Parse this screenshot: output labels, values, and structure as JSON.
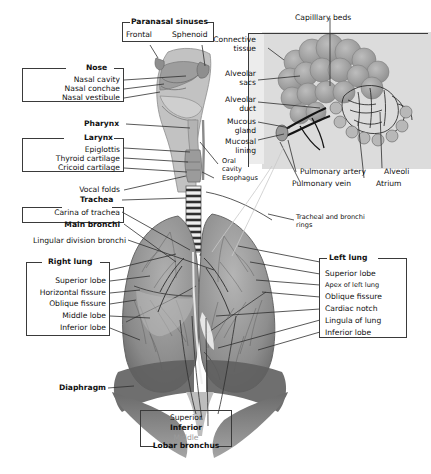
{
  "figure": {
    "style": "grayscale medical illustration with leader-line callouts"
  },
  "groups": {
    "paranasal_sinuses": {
      "header": "Paranasal sinuses",
      "items": [
        "Frontal",
        "Sphenoid"
      ]
    },
    "nose": {
      "header": "Nose",
      "items": [
        "Nasal cavity",
        "Nasal conchae",
        "Nasal vestibule"
      ]
    },
    "pharynx": {
      "header": "Pharynx"
    },
    "larynx": {
      "header": "Larynx",
      "items": [
        "Epiglottis",
        "Thyroid cartilage",
        "Cricoid cartilage"
      ]
    },
    "vocal_folds": {
      "label": "Vocal folds"
    },
    "trachea": {
      "header": "Trachea",
      "items": [
        "Carina of trachea"
      ]
    },
    "main_bronchi": {
      "label": "Main bronchi"
    },
    "lingular_division_bronchi": {
      "label": "Lingular division bronchi"
    },
    "right_lung": {
      "header": "Right lung",
      "items": [
        "Superior lobe",
        "Horizontal fissure",
        "Oblique fissure",
        "Middle lobe",
        "Inferior lobe"
      ]
    },
    "left_lung": {
      "header": "Left lung",
      "items": [
        "Superior lobe",
        "Apex of left lung",
        "Oblique fissure",
        "Cardiac notch",
        "Lingula of lung",
        "Inferior lobe"
      ]
    },
    "diaphragm": {
      "label": "Diaphragm"
    },
    "lobar_bronchus": {
      "header": "Lobar bronchus",
      "items": [
        "Superior",
        "Inferior",
        "Middle"
      ]
    },
    "inset": {
      "capillary_beds": "Capilllary beds",
      "connective_tissue": "Connective\ntissue",
      "alveolar_sacs": "Alveolar\nsacs",
      "alveolar_duct": "Alveolar\nduct",
      "mucous_gland": "Mucous\ngland",
      "mucosal_lining": "Mucosal\nlining",
      "pulmonary_artery": "Pulmonary artery",
      "pulmonary_vein": "Pulmonary vein",
      "alveoli": "Alveoli",
      "atrium": "Atrium"
    },
    "misc": {
      "oral_cavity": "Oral\ncavity",
      "esophagus": "Esophagus",
      "tracheal_rings": "Tracheal and bronchi\nrings"
    }
  },
  "colors": {
    "background": "#ffffff",
    "text": "#111111",
    "line": "#2e2e2e",
    "frame": "#3a3a3a",
    "inset_panel": "#d8d8d8",
    "tissue_mid": "#a6a6a6",
    "tissue_dark": "#6e6e6e",
    "tissue_light": "#c9c9c9",
    "muted_text": "#9a9a9a"
  }
}
